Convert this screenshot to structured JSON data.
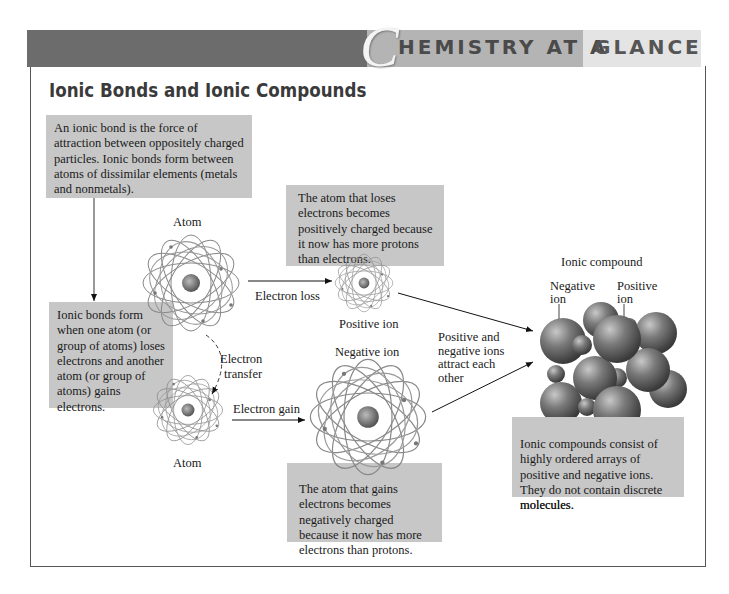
{
  "header": {
    "initial": "C",
    "title_rest": "HEMISTRY AT A",
    "title_end": "GLANCE",
    "colors": {
      "dark": "#6c6c6c",
      "mid": "#b4b4b4",
      "light": "#e4e4e4",
      "box": "#c7c7c7"
    }
  },
  "page_title": "Ionic Bonds and Ionic Compounds",
  "boxes": {
    "definition": "An ionic bond is the force of attraction between oppositely charged particles. Ionic bonds form between atoms of dissimilar elements (metals and nonmetals).",
    "formation": "Ionic bonds form when one atom (or group of atoms) loses electrons and another atom (or group of atoms) gains electrons.",
    "positive": "The atom that loses electrons becomes positively charged because it now has more protons than electrons.",
    "negative": "The atom that gains electrons becomes negatively charged because it now has more electrons than protons.",
    "compound": "Ionic compounds consist of highly ordered arrays of positive and negative ions. They do not contain discrete molecules."
  },
  "labels": {
    "atom_top": "Atom",
    "atom_bottom": "Atom",
    "electron_loss": "Electron loss",
    "electron_gain": "Electron gain",
    "electron_transfer_1": "Electron",
    "electron_transfer_2": "transfer",
    "positive_ion": "Positive ion",
    "negative_ion": "Negative ion",
    "attract_1": "Positive and",
    "attract_2": "negative ions",
    "attract_3": "attract each",
    "attract_4": "other",
    "ionic_compound": "Ionic compound",
    "neg_ion_1": "Negative",
    "neg_ion_2": "ion",
    "pos_ion_1": "Positive",
    "pos_ion_2": "ion"
  }
}
